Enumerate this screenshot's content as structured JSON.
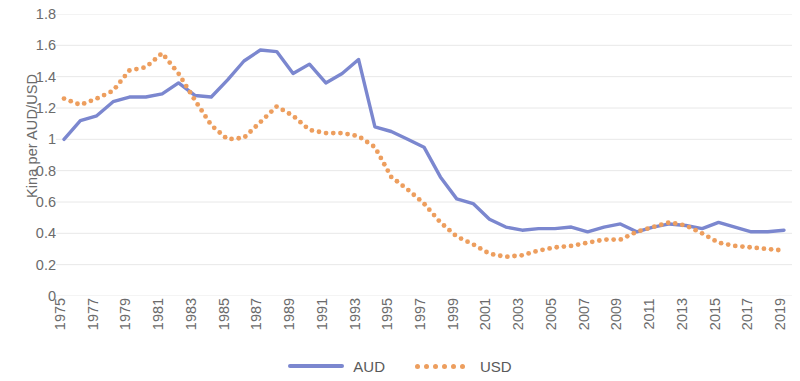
{
  "chart_data": {
    "type": "line",
    "title": "",
    "xlabel": "",
    "ylabel": "Kina per AUD/USD",
    "ylim": [
      0,
      1.8
    ],
    "ytick_labels": [
      "1.8",
      "1.6",
      "1.4",
      "1.2",
      "1",
      "0.8",
      "0.6",
      "0.4",
      "0.2",
      "0"
    ],
    "ytick_values": [
      1.8,
      1.6,
      1.4,
      1.2,
      1.0,
      0.8,
      0.6,
      0.4,
      0.2,
      0
    ],
    "grid": true,
    "legend_position": "bottom",
    "x": [
      1975,
      1976,
      1977,
      1978,
      1979,
      1980,
      1981,
      1982,
      1983,
      1984,
      1985,
      1986,
      1987,
      1988,
      1989,
      1990,
      1991,
      1992,
      1993,
      1994,
      1995,
      1996,
      1997,
      1998,
      1999,
      2000,
      2001,
      2002,
      2003,
      2004,
      2005,
      2006,
      2007,
      2008,
      2009,
      2010,
      2011,
      2012,
      2013,
      2014,
      2015,
      2016,
      2017,
      2018,
      2019
    ],
    "xtick_labels": [
      "1975",
      "1977",
      "1979",
      "1981",
      "1983",
      "1985",
      "1987",
      "1989",
      "1991",
      "1993",
      "1995",
      "1997",
      "1999",
      "2001",
      "2003",
      "2005",
      "2007",
      "2009",
      "2011",
      "2013",
      "2015",
      "2017",
      "2019"
    ],
    "series": [
      {
        "name": "AUD",
        "color": "#7b87cf",
        "style": "solid",
        "values": [
          1.0,
          1.12,
          1.15,
          1.24,
          1.27,
          1.27,
          1.29,
          1.36,
          1.28,
          1.27,
          1.38,
          1.5,
          1.57,
          1.56,
          1.42,
          1.48,
          1.36,
          1.42,
          1.51,
          1.08,
          1.05,
          1.0,
          0.95,
          0.76,
          0.62,
          0.59,
          0.49,
          0.44,
          0.42,
          0.43,
          0.43,
          0.44,
          0.41,
          0.44,
          0.46,
          0.41,
          0.44,
          0.46,
          0.45,
          0.43,
          0.47,
          0.44,
          0.41,
          0.41,
          0.42
        ]
      },
      {
        "name": "USD",
        "color": "#ed9e5e",
        "style": "dotted",
        "values": [
          1.26,
          1.22,
          1.26,
          1.31,
          1.44,
          1.46,
          1.55,
          1.42,
          1.25,
          1.09,
          1.0,
          1.01,
          1.11,
          1.21,
          1.15,
          1.06,
          1.04,
          1.04,
          1.02,
          0.95,
          0.76,
          0.68,
          0.59,
          0.47,
          0.38,
          0.33,
          0.27,
          0.25,
          0.26,
          0.29,
          0.31,
          0.32,
          0.34,
          0.36,
          0.36,
          0.41,
          0.44,
          0.47,
          0.45,
          0.4,
          0.34,
          0.32,
          0.31,
          0.3,
          0.29
        ]
      }
    ]
  },
  "legend": {
    "items": [
      {
        "label": "AUD",
        "icon": "solid-line-swatch"
      },
      {
        "label": "USD",
        "icon": "dotted-line-swatch"
      }
    ]
  }
}
